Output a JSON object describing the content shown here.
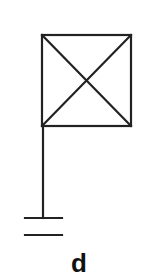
{
  "diagram": {
    "type": "symbol",
    "label": "d",
    "stroke_color": "#222222",
    "elements": {
      "box": {
        "x": 42,
        "y": 35,
        "width": 89,
        "height": 91
      },
      "pole": {
        "x": 43,
        "y1": 126,
        "y2": 218
      },
      "bar_top": {
        "x1": 25,
        "x2": 62,
        "y": 218
      },
      "bar_bottom": {
        "x1": 25,
        "x2": 62,
        "y": 235
      }
    }
  }
}
